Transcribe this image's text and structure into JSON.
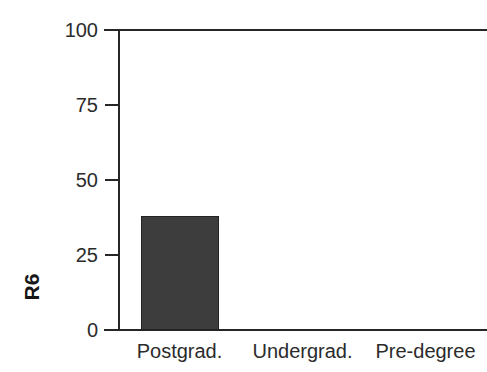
{
  "chart_data": {
    "type": "bar",
    "title": "",
    "subtitle": "",
    "xlabel": "",
    "ylabel": "R6",
    "categories": [
      "Postgrad.",
      "Undergrad.",
      "Pre-degree"
    ],
    "values": [
      38,
      0,
      0
    ],
    "series": [
      {
        "name": "R6",
        "values": [
          38,
          0,
          0
        ]
      }
    ],
    "ylim": [
      0,
      100
    ],
    "yticks": [
      0,
      25,
      50,
      75,
      100
    ],
    "ytick_labels": [
      "0",
      "25",
      "50",
      "75",
      "100"
    ],
    "grid": false,
    "legend": null,
    "legend_position": "none",
    "annotations": [],
    "bar_color": "#3d3d3d",
    "bar_edge_color": "#232323",
    "axis_color": "#262626",
    "text_color": "#2b2b2b",
    "background": "#ffffff"
  },
  "axes": {
    "y_title": "R6",
    "y_tick_labels": [
      "100",
      "75",
      "50",
      "25",
      "0"
    ],
    "x_tick_labels": [
      "Postgrad.",
      "Undergrad.",
      "Pre-degree"
    ]
  }
}
